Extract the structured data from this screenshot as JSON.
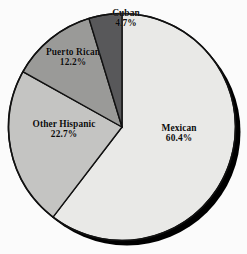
{
  "chart_data": {
    "type": "pie",
    "title": "",
    "subtitle": "",
    "xlabel": "",
    "ylabel": "",
    "legend_position": "none",
    "grid": false,
    "labels_on_slices": true,
    "start_angle_deg": 0,
    "direction": "clockwise",
    "units": "percent",
    "total": 100.0,
    "categories": [
      "Mexican",
      "Other Hispanic",
      "Puerto Rican",
      "Cuban"
    ],
    "values": [
      60.4,
      22.7,
      12.2,
      4.7
    ],
    "slices": [
      {
        "name": "Mexican",
        "value": 60.4,
        "value_label": "60.4%",
        "color": "#e9e9e7",
        "start_deg": 0.0,
        "end_deg": 217.44,
        "label_name": "Mexican",
        "label_pct": "60.4%"
      },
      {
        "name": "Other Hispanic",
        "value": 22.7,
        "value_label": "22.7%",
        "color": "#c4c4c2",
        "start_deg": 217.44,
        "end_deg": 299.16,
        "label_name": "Other Hispanic",
        "label_pct": "22.7%"
      },
      {
        "name": "Puerto Rican",
        "value": 12.2,
        "value_label": "12.2%",
        "color": "#9a9a98",
        "start_deg": 299.16,
        "end_deg": 343.08,
        "label_name": "Puerto Rican",
        "label_pct": "12.2%"
      },
      {
        "name": "Cuban",
        "value": 4.7,
        "value_label": "4.7%",
        "color": "#58585a",
        "start_deg": 343.08,
        "end_deg": 360.0,
        "label_name": "Cuban",
        "label_pct": "4.7%"
      }
    ],
    "colors": {
      "mexican": "#e9e9e7",
      "other_hispanic": "#c4c4c2",
      "puerto_rican": "#9a9a98",
      "cuban": "#58585a",
      "outline": "#111111",
      "shadow": "#000000",
      "background": "#fbfbfb",
      "label_text": "#0b0b0b"
    }
  }
}
